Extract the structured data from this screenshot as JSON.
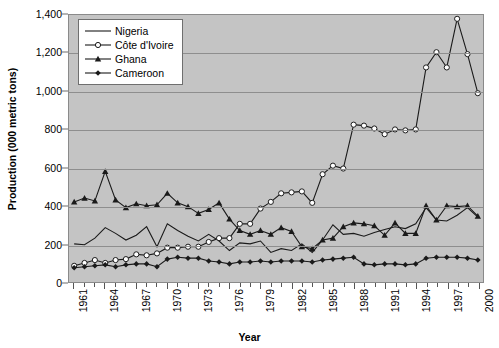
{
  "chart_data": {
    "type": "line",
    "title": "",
    "xlabel": "Year",
    "ylabel": "Production (000 metric tons)",
    "ylim": [
      0,
      1400
    ],
    "ytick_step": 200,
    "ytick_labels": [
      "0",
      "200",
      "400",
      "600",
      "800",
      "1,000",
      "1,200",
      "1,400"
    ],
    "grid": true,
    "legend_position": "top-left",
    "plot_background": "#c4c4c4",
    "gridline_color": "#8e8e8e",
    "x": [
      1961,
      1962,
      1963,
      1964,
      1965,
      1966,
      1967,
      1968,
      1969,
      1970,
      1971,
      1972,
      1973,
      1974,
      1975,
      1976,
      1977,
      1978,
      1979,
      1980,
      1981,
      1982,
      1983,
      1984,
      1985,
      1986,
      1987,
      1988,
      1989,
      1990,
      1991,
      1992,
      1993,
      1994,
      1995,
      1996,
      1997,
      1998,
      1999,
      2000
    ],
    "xtick_labels": [
      "1961",
      "1964",
      "1967",
      "1970",
      "1973",
      "1976",
      "1979",
      "1982",
      "1985",
      "1988",
      "1991",
      "1994",
      "1997",
      "2000"
    ],
    "xtick_every": 3,
    "series": [
      {
        "name": "Nigeria",
        "marker": "none",
        "color": "#1a1a1a",
        "values": [
          200,
          195,
          230,
          285,
          255,
          220,
          245,
          290,
          185,
          305,
          270,
          240,
          215,
          250,
          215,
          165,
          205,
          200,
          215,
          155,
          175,
          165,
          200,
          155,
          220,
          300,
          250,
          255,
          240,
          260,
          275,
          290,
          280,
          305,
          390,
          325,
          320,
          350,
          390,
          340
        ]
      },
      {
        "name": "Côte d'Ivoire",
        "marker": "open-circle",
        "color": "#1a1a1a",
        "values": [
          85,
          100,
          115,
          100,
          115,
          120,
          145,
          140,
          150,
          180,
          180,
          185,
          185,
          210,
          230,
          230,
          305,
          305,
          385,
          420,
          465,
          470,
          475,
          415,
          565,
          610,
          595,
          825,
          820,
          805,
          775,
          800,
          795,
          800,
          1125,
          1205,
          1125,
          1380,
          1195,
          990
        ]
      },
      {
        "name": "Ghana",
        "marker": "filled-triangle",
        "color": "#1a1a1a",
        "values": [
          420,
          440,
          425,
          580,
          430,
          390,
          410,
          400,
          405,
          465,
          415,
          395,
          360,
          380,
          415,
          330,
          270,
          250,
          270,
          250,
          285,
          265,
          185,
          175,
          220,
          230,
          290,
          310,
          305,
          295,
          245,
          310,
          255,
          255,
          400,
          325,
          400,
          395,
          400,
          345
        ]
      },
      {
        "name": "Cameroon",
        "marker": "filled-diamond",
        "color": "#1a1a1a",
        "values": [
          75,
          80,
          85,
          90,
          80,
          90,
          95,
          95,
          80,
          120,
          130,
          125,
          125,
          110,
          105,
          95,
          105,
          105,
          110,
          105,
          110,
          110,
          110,
          105,
          115,
          120,
          125,
          130,
          95,
          90,
          95,
          95,
          90,
          95,
          125,
          130,
          130,
          130,
          125,
          115
        ]
      }
    ]
  },
  "legend": {
    "items": [
      {
        "label": "Nigeria",
        "symbol": "line"
      },
      {
        "label": "Côte d'Ivoire",
        "symbol": "line-open-circle"
      },
      {
        "label": "Ghana",
        "symbol": "line-filled-triangle"
      },
      {
        "label": "Cameroon",
        "symbol": "line-filled-diamond"
      }
    ]
  }
}
